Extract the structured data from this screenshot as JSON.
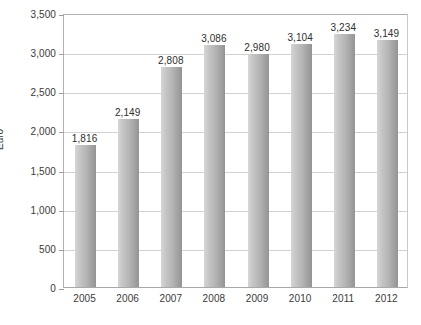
{
  "chart_data": {
    "type": "bar",
    "title": "",
    "xlabel": "",
    "ylabel": "Euro",
    "categories": [
      "2005",
      "2006",
      "2007",
      "2008",
      "2009",
      "2010",
      "2011",
      "2012"
    ],
    "values": [
      1816,
      2149,
      2808,
      3086,
      2980,
      3104,
      3234,
      3149
    ],
    "data_labels": [
      "1,816",
      "2,149",
      "2,808",
      "3,086",
      "2,980",
      "3,104",
      "3,234",
      "3,149"
    ],
    "ylim": [
      0,
      3500
    ],
    "ytick_values": [
      0,
      500,
      1000,
      1500,
      2000,
      2500,
      3000,
      3500
    ],
    "ytick_labels": [
      "0",
      "500",
      "1,000",
      "1,500",
      "2,000",
      "2,500",
      "3,000",
      "3,500"
    ],
    "grid": true,
    "legend": false,
    "bar_color": "#b4b4b4",
    "gridline_color": "#d2d2d2",
    "axis_color": "#a8a8a8",
    "background_color": "#ffffff"
  },
  "caption": {
    "text": ""
  }
}
